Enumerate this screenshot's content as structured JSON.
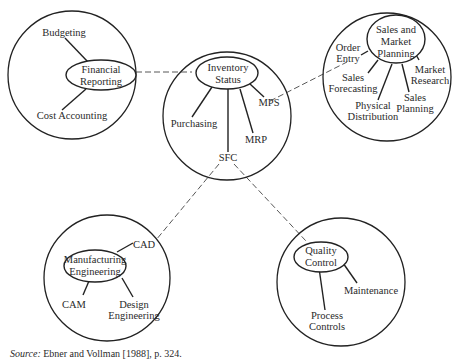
{
  "diagram": {
    "clusters": {
      "financial": {
        "hub": [
          "Financial",
          "Reporting"
        ],
        "nodes": {
          "budgeting": "Budgeting",
          "cost_accounting": "Cost Accounting"
        }
      },
      "inventory": {
        "hub": [
          "Inventory",
          "Status"
        ],
        "nodes": {
          "purchasing": "Purchasing",
          "mrp": "MRP",
          "mps": "MPS",
          "sfc": "SFC"
        }
      },
      "sales": {
        "hub": [
          "Sales and",
          "Market",
          "Planning"
        ],
        "nodes": {
          "order_entry": [
            "Order",
            "Entry"
          ],
          "sales_forecasting": [
            "Sales",
            "Forecasting"
          ],
          "physical_distribution": [
            "Physical",
            "Distribution"
          ],
          "sales_planning": [
            "Sales",
            "Planning"
          ],
          "market_research": [
            "Market",
            "Research"
          ]
        }
      },
      "manufacturing": {
        "hub": [
          "Manufacturing",
          "Engineering"
        ],
        "nodes": {
          "cad": "CAD",
          "cam": "CAM",
          "design_engineering": [
            "Design",
            "Engineering"
          ]
        }
      },
      "quality": {
        "hub": [
          "Quality",
          "Control"
        ],
        "nodes": {
          "maintenance": "Maintenance",
          "process_controls": [
            "Process",
            "Controls"
          ]
        }
      }
    },
    "links": [
      [
        "Financial Reporting",
        "Inventory Status"
      ],
      [
        "MPS",
        "Order Entry"
      ],
      [
        "SFC",
        "CAD"
      ],
      [
        "SFC",
        "Quality Control"
      ]
    ]
  },
  "source": {
    "label": "Source:",
    "text": " Ebner and Vollman [1988], p. 324."
  }
}
